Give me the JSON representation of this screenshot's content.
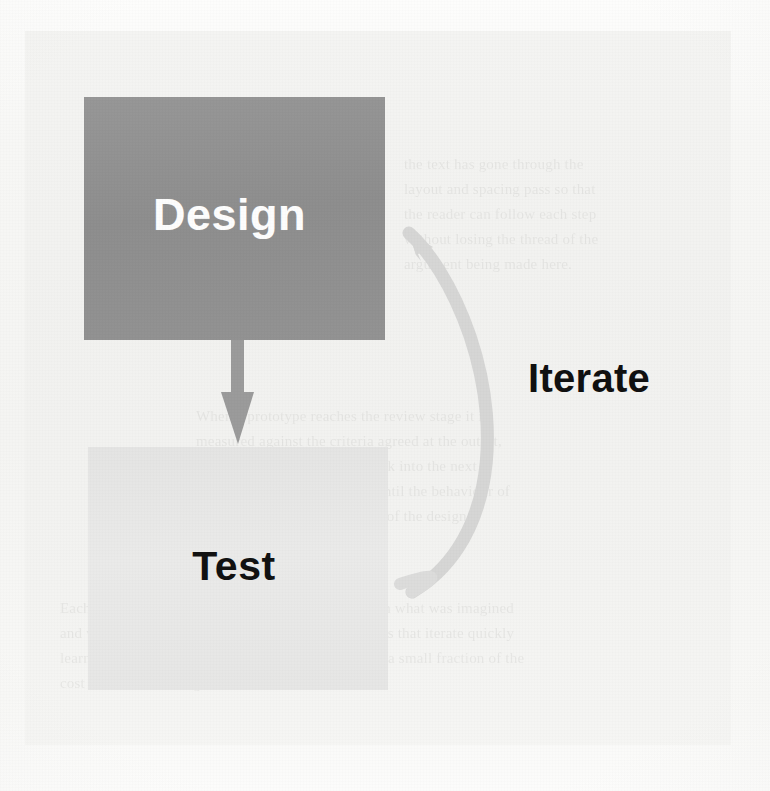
{
  "figure": {
    "kind": "process-loop-diagram",
    "background_color": "#f4f4f2",
    "panel_color": "#f1f1ef"
  },
  "nodes": [
    {
      "id": "design",
      "label": "Design",
      "fill_color": "#919191",
      "text_color": "#fdfdfd",
      "x": 84,
      "y": 97,
      "width": 301,
      "height": 243
    },
    {
      "id": "test",
      "label": "Test",
      "fill_color": "#e7e7e6",
      "text_color": "#121212",
      "x": 88,
      "y": 447,
      "width": 300,
      "height": 243
    }
  ],
  "connectors": [
    {
      "id": "design-to-test",
      "from": "design",
      "to": "test",
      "label": "",
      "style": "straight-down-arrow",
      "color": "#9b9b9b"
    },
    {
      "id": "test-to-design",
      "from": "test",
      "to": "design",
      "label": "Iterate",
      "style": "curved-feedback-arrow",
      "color": "#d5d5d4"
    }
  ],
  "labels": {
    "iterate": {
      "text": "Iterate",
      "color": "#111111",
      "x": 528,
      "y": 356,
      "font_size": 40
    }
  },
  "ghost_text": {
    "block_a": "the text has gone through the\nlayout and spacing pass so that\nthe reader can follow each step\nwithout losing the thread of the\nargument being made here.",
    "block_b": "When a prototype reaches the review stage it is\nmeasured against the criteria agreed at the outset,\nand the findings are folded back into the next\nrevision. The loop continues until the behaviour of\nthe product matches the intent of the design.",
    "block_c": "Each pass through the cycle narrows the gap between what was imagined\nand what actually works in the hands of a user. Teams that iterate quickly\nlearn quickly, and the cost of a change made early is a small fraction of the\ncost of the same change made late in the schedule."
  }
}
